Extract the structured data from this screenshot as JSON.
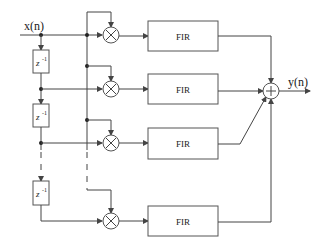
{
  "diagram": {
    "input_label": "x(n)",
    "output_label": "y(n)",
    "delay_label": "z",
    "delay_exponent": "-1",
    "fir_blocks": [
      {
        "label": "FIR"
      },
      {
        "label": "FIR"
      },
      {
        "label": "FIR"
      },
      {
        "label": "FIR"
      }
    ],
    "multiplier_symbol": "×",
    "summer_symbol": "+",
    "colors": {
      "line": "#444444",
      "background": "#ffffff"
    }
  }
}
